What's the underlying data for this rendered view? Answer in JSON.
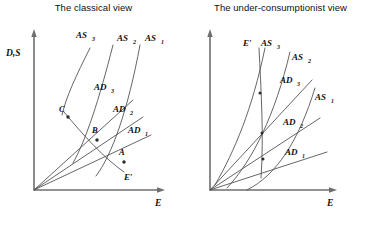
{
  "figure": {
    "panels": [
      {
        "id": "classical",
        "title": "The classical view",
        "axes": {
          "y_label": "D,S",
          "x_label": "E"
        },
        "supply_curves": [
          {
            "label": "AS",
            "sub": "3"
          },
          {
            "label": "AS",
            "sub": "2"
          },
          {
            "label": "AS",
            "sub": "1"
          }
        ],
        "demand_curves": [
          {
            "label": "AD",
            "sub": "3"
          },
          {
            "label": "AD",
            "sub": "2"
          },
          {
            "label": "AD",
            "sub": "1"
          }
        ],
        "equilibria": [
          {
            "label": "C"
          },
          {
            "label": "B"
          },
          {
            "label": "A"
          }
        ],
        "locus": {
          "label": "E′"
        }
      },
      {
        "id": "under-consumptionist",
        "title": "The under-consumptionist view",
        "axes": {
          "y_label": "",
          "x_label": "E"
        },
        "supply_curves": [
          {
            "label": "AS",
            "sub": "3"
          },
          {
            "label": "AS",
            "sub": "2"
          },
          {
            "label": "AS",
            "sub": "1"
          }
        ],
        "demand_curves": [
          {
            "label": "AD",
            "sub": "3"
          },
          {
            "label": "AD",
            "sub": "2"
          },
          {
            "label": "AD",
            "sub": "1"
          }
        ],
        "equilibria": [],
        "locus": {
          "label": "E′"
        }
      }
    ],
    "colors": {
      "axis": "#6e6e6e",
      "curve": "#4a4a4a",
      "text": "#111111",
      "background": "#ffffff"
    }
  }
}
